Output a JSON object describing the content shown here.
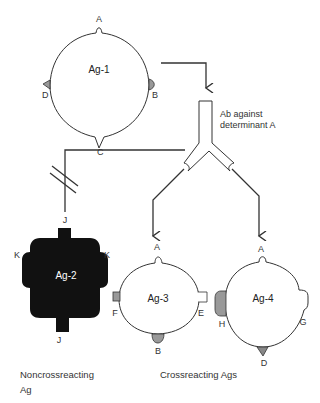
{
  "diagram": {
    "antibody_label_line1": "Ab against",
    "antibody_label_line2": "determinant A",
    "antigens": {
      "ag1": {
        "name": "Ag-1",
        "determinants": {
          "top": "A",
          "right": "B",
          "bottom": "C",
          "left": "D"
        }
      },
      "ag2": {
        "name": "Ag-2",
        "determinants": {
          "top": "J",
          "left": "K",
          "right": "K",
          "bottom": "J"
        }
      },
      "ag3": {
        "name": "Ag-3",
        "determinants": {
          "top": "A",
          "left": "F",
          "right": "E",
          "bottom": "B"
        }
      },
      "ag4": {
        "name": "Ag-4",
        "determinants": {
          "top": "A",
          "left": "H",
          "right": "G",
          "bottom": "D"
        }
      }
    },
    "captions": {
      "noncrossreacting_line1": "Noncrossreacting",
      "noncrossreacting_line2": "Ag",
      "crossreacting": "Crossreacting Ags"
    },
    "colors": {
      "line": "#333333",
      "fill_dark": "#111111",
      "fill_gray": "#999999",
      "background": "#ffffff"
    }
  }
}
